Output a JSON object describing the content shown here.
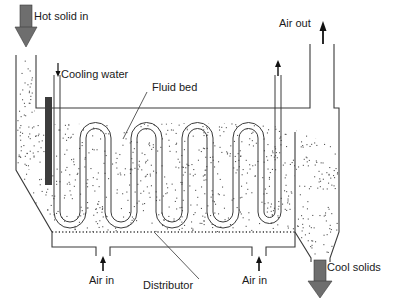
{
  "diagram": {
    "labels": {
      "hot_solid_in": "Hot solid in",
      "cooling_water": "Cooling water",
      "fluid_bed": "Fluid bed",
      "air_out": "Air out",
      "air_in_left": "Air in",
      "air_in_right": "Air in",
      "distributor": "Distributor",
      "cool_solids": "Cool solids"
    },
    "colors": {
      "line": "#3a3a3a",
      "big_arrow": "#6e6e6e",
      "heater_bar": "#3c3c3c",
      "particle": "#555555"
    },
    "components": [
      "solid-feed-chute",
      "immersed-heater",
      "cooling-water-serpentine",
      "fluid-bed",
      "distributor-plate",
      "air-plenum",
      "air-outlet-duct",
      "overflow-weir",
      "discharge-cone"
    ]
  }
}
